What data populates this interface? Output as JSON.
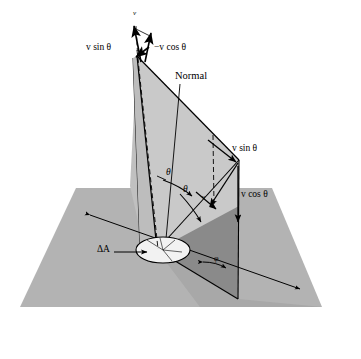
{
  "figure": {
    "background": "#ffffff",
    "width": 361,
    "height": 359
  },
  "colors": {
    "ground_plane": "#b3b3b3",
    "dark_wedge": "#8a8a8a",
    "tilted_plane": "#c9c9c9",
    "tilted_plane_dark": "#a8a8a8",
    "patch_ellipse": "#f2f2f2",
    "line": "#000000",
    "background": "#ffffff"
  },
  "labels": {
    "velocity": "v",
    "v_sin_theta_left": "v sin θ",
    "minus_v_cos_theta": "−v cos θ",
    "normal": "Normal",
    "v_sin_theta_right": "v sin θ",
    "v_cos_theta_right": "v cos θ",
    "delta_area": "ΔA",
    "theta_upper": "θ",
    "theta_lower": "θ",
    "phi": "φ",
    "v_small": "v"
  },
  "label_parts": {
    "v_italic": "v",
    "sin_text": "sin",
    "cos_text": "cos",
    "theta_glyph": "θ",
    "minus_glyph": "−",
    "delta_glyph": "Δ",
    "a_italic": "A",
    "phi_glyph": "φ",
    "normal_text": "Normal"
  },
  "geometry": {
    "apex": [
      134,
      22
    ],
    "vector_origin": [
      137,
      56
    ],
    "surface_center": [
      157,
      250
    ],
    "plane_right_base": [
      238,
      299
    ],
    "plane_right_top": [
      239,
      160
    ]
  },
  "elements": [
    {
      "name": "ground-plane",
      "kind": "polygon",
      "label": ""
    },
    {
      "name": "dark-wedge",
      "kind": "polygon",
      "label": ""
    },
    {
      "name": "tilted-plane",
      "kind": "polygon",
      "label": ""
    },
    {
      "name": "normal-line",
      "kind": "line",
      "label": "Normal"
    },
    {
      "name": "velocity-vector",
      "kind": "arrow",
      "label": "v"
    },
    {
      "name": "v-sin-theta-vector-left",
      "kind": "arrow",
      "label": "v sin θ"
    },
    {
      "name": "minus-v-cos-theta-vector",
      "kind": "arrow",
      "label": "−v cos θ"
    },
    {
      "name": "v-sin-theta-vector-right",
      "kind": "arrow",
      "label": "v sin θ"
    },
    {
      "name": "v-cos-theta-vector-right",
      "kind": "arrow",
      "label": "v cos θ"
    },
    {
      "name": "area-element-ellipse",
      "kind": "ellipse",
      "label": "ΔA"
    },
    {
      "name": "theta-angle-upper",
      "kind": "angle-arc",
      "label": "θ"
    },
    {
      "name": "theta-angle-lower",
      "kind": "angle-arc",
      "label": "θ"
    },
    {
      "name": "phi-angle",
      "kind": "angle-arc",
      "label": "φ"
    }
  ]
}
